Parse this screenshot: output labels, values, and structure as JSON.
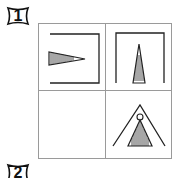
{
  "question_labels": [
    {
      "number": "1"
    },
    {
      "number": "2"
    }
  ],
  "puzzle": {
    "grid_size": "2x2",
    "cells": [
      {
        "position": "top-left",
        "content": "bracket-open-left with horizontal-hatched wedge pointing right"
      },
      {
        "position": "top-right",
        "content": "bracket-open-bottom with horizontal-hatched wedge pointing up"
      },
      {
        "position": "bottom-left",
        "content": "empty"
      },
      {
        "position": "bottom-right",
        "content": "open chevron with circle and vertical-hatched triangle"
      }
    ]
  }
}
